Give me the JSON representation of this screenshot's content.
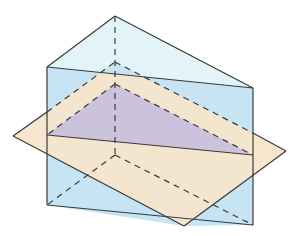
{
  "diagram": {
    "type": "geometry-3d",
    "colors": {
      "top_face": "#e3f4f9",
      "front_face": "#c6e4f3",
      "plane": "#f6e5cb",
      "section": "#cbc3dc",
      "edge": "#3a3a3a"
    },
    "prism": {
      "top_back": [
        115,
        16
      ],
      "top_left": [
        47,
        67
      ],
      "top_right": [
        253,
        88
      ],
      "bottom_back": [
        115,
        155
      ],
      "bottom_left": [
        47,
        205
      ],
      "bottom_right": [
        253,
        225
      ]
    },
    "plane": {
      "left": [
        13,
        136
      ],
      "top": [
        115,
        62
      ],
      "right": [
        286,
        151
      ],
      "bottom": [
        184,
        226
      ]
    },
    "section": {
      "apex": [
        115,
        84
      ],
      "left": [
        47,
        135
      ],
      "right": [
        253,
        155
      ]
    }
  }
}
